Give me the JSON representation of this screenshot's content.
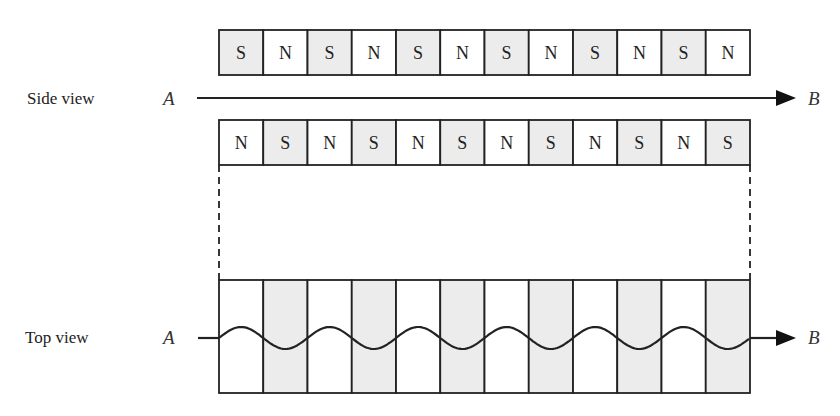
{
  "side_view": {
    "label": "Side view",
    "start_label": "A",
    "end_label": "B",
    "upper_row": [
      "S",
      "N",
      "S",
      "N",
      "S",
      "N",
      "S",
      "N",
      "S",
      "N",
      "S",
      "N"
    ],
    "lower_row": [
      "N",
      "S",
      "N",
      "S",
      "N",
      "S",
      "N",
      "S",
      "N",
      "S",
      "N",
      "S"
    ]
  },
  "top_view": {
    "label": "Top view",
    "start_label": "A",
    "end_label": "B",
    "columns": 12,
    "shading": [
      "white",
      "gray",
      "white",
      "gray",
      "white",
      "gray",
      "white",
      "gray",
      "white",
      "gray",
      "white",
      "gray"
    ]
  },
  "colors": {
    "s_pole_fill": "#ececec",
    "n_pole_fill": "#ffffff",
    "stroke": "#222222",
    "gray_column": "#ececec"
  }
}
